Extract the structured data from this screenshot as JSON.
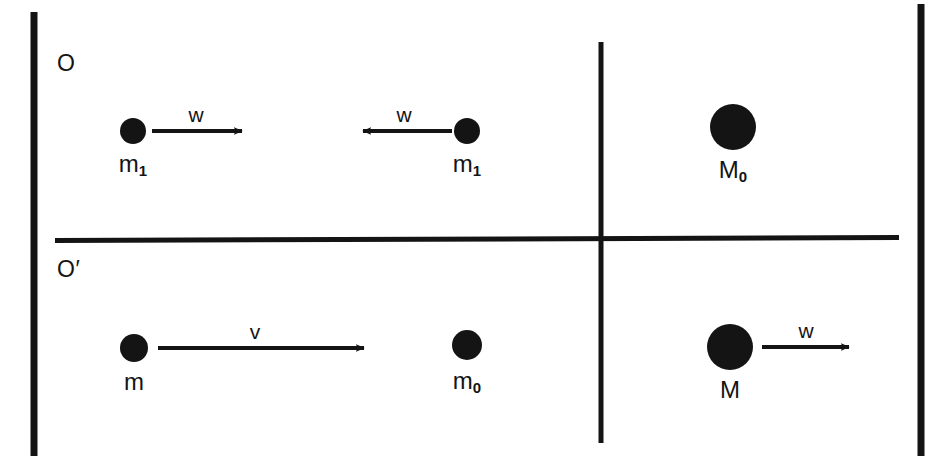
{
  "figure": {
    "type": "physics-diagram",
    "background_color": "#ffffff",
    "ink_color": "#141414"
  },
  "frames": [
    {
      "id": "frame-O",
      "label": "O",
      "label_x": 57,
      "label_y": 52,
      "bodies": [
        {
          "name": "body-m1-left",
          "label": "m",
          "subscript": "1",
          "cx": 133,
          "cy": 131,
          "r": 13,
          "label_x": 133,
          "label_y": 152,
          "velocity": {
            "name": "arrow-w-right",
            "label": "w",
            "direction": "right",
            "x1": 152,
            "x2": 250,
            "y": 131,
            "label_x": 196,
            "label_y": 104
          }
        },
        {
          "name": "body-m1-right",
          "label": "m",
          "subscript": "1",
          "cx": 467,
          "cy": 131,
          "r": 13,
          "label_x": 467,
          "label_y": 152,
          "velocity": {
            "name": "arrow-w-left",
            "label": "w",
            "direction": "left",
            "x1": 452,
            "x2": 355,
            "y": 131,
            "label_x": 404,
            "label_y": 104
          }
        },
        {
          "name": "body-M0",
          "label": "M",
          "subscript": "0",
          "cx": 733,
          "cy": 127,
          "r": 23,
          "label_x": 733,
          "label_y": 158,
          "velocity": null
        }
      ]
    },
    {
      "id": "frame-O-prime",
      "label": "O′",
      "label_x": 57,
      "label_y": 258,
      "bodies": [
        {
          "name": "body-m",
          "label": "m",
          "subscript": "",
          "cx": 134,
          "cy": 348,
          "r": 14,
          "label_x": 134,
          "label_y": 370,
          "velocity": {
            "name": "arrow-v-right",
            "label": "v",
            "direction": "right",
            "x1": 158,
            "x2": 372,
            "y": 348,
            "label_x": 255,
            "label_y": 321
          }
        },
        {
          "name": "body-m0",
          "label": "m",
          "subscript": "0",
          "cx": 467,
          "cy": 345,
          "r": 15,
          "label_x": 467,
          "label_y": 369,
          "velocity": null
        },
        {
          "name": "body-M",
          "label": "M",
          "subscript": "",
          "cx": 730,
          "cy": 347,
          "r": 23,
          "label_x": 730,
          "label_y": 378,
          "velocity": {
            "name": "arrow-w-right-M",
            "label": "w",
            "direction": "right",
            "x1": 762,
            "x2": 857,
            "y": 347,
            "label_x": 806,
            "label_y": 320
          }
        }
      ]
    }
  ],
  "rules": [
    {
      "name": "left-border",
      "orientation": "vertical",
      "x1": 34,
      "y1": 12,
      "x2": 34,
      "y2": 456,
      "width": 7
    },
    {
      "name": "right-border",
      "orientation": "vertical",
      "x1": 921,
      "y1": 4,
      "x2": 921,
      "y2": 456,
      "width": 7
    },
    {
      "name": "frame-divider-horizontal",
      "orientation": "horizontal",
      "x1": 55,
      "y1": 240,
      "x2": 899,
      "y2": 238,
      "width": 5
    },
    {
      "name": "panel-divider-vertical",
      "orientation": "vertical",
      "x1": 601,
      "y1": 42,
      "x2": 601,
      "y2": 443,
      "width": 5
    }
  ]
}
